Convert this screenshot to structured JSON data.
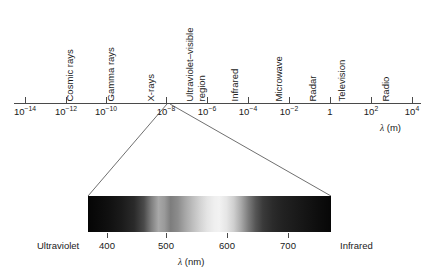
{
  "chart_data": {
    "type": "line",
    "title": "",
    "xlabel": "λ (m)",
    "ylabel": "",
    "grid": false,
    "legend": null,
    "em_axis": {
      "scale": "log10",
      "unit": "m",
      "axis_label": "λ (m)",
      "xlim": [
        -15,
        5
      ],
      "tick_exponents": [
        -14,
        -12,
        -10,
        -8,
        -6,
        -4,
        -2,
        0,
        2,
        4
      ],
      "tick_labels": [
        "10⁻¹⁴",
        "10⁻¹²",
        "10⁻¹⁰",
        "10⁻⁸",
        "10⁻⁶",
        "10⁻⁴",
        "10⁻²",
        "1",
        "10²",
        "10⁴"
      ],
      "regions": [
        {
          "label": "Cosmic rays",
          "lines": [
            "Cosmic rays"
          ],
          "exponent": -14
        },
        {
          "label": "Gamma rays",
          "lines": [
            "Gamma rays"
          ],
          "exponent": -12
        },
        {
          "label": "X-rays",
          "lines": [
            "X-rays"
          ],
          "exponent": -10
        },
        {
          "label": "Ultraviolet–visible region",
          "lines": [
            "Ultraviolet–visible",
            "region"
          ],
          "exponent": -8
        },
        {
          "label": "Infrared",
          "lines": [
            "Infrared"
          ],
          "exponent": -6
        },
        {
          "label": "Microwave",
          "lines": [
            "Microwave"
          ],
          "exponent": -4
        },
        {
          "label": "Radar",
          "lines": [
            "Radar"
          ],
          "exponent": -3
        },
        {
          "label": "Television",
          "lines": [
            "Television"
          ],
          "exponent": -2
        },
        {
          "label": "Radio",
          "lines": [
            "Radio"
          ],
          "exponent": 0
        }
      ]
    },
    "visible_band": {
      "unit": "nm",
      "axis_label": "λ (nm)",
      "xlim": [
        380,
        780
      ],
      "tick_values": [
        400,
        500,
        600,
        700
      ],
      "tick_labels": [
        "400",
        "500",
        "600",
        "700"
      ],
      "left_endcap_label": "Ultraviolet",
      "right_endcap_label": "Infrared",
      "rendering": "grayscale",
      "gradient_stops": [
        {
          "pos_pct": 0,
          "color": "#050505"
        },
        {
          "pos_pct": 14,
          "color": "#1b1b1b"
        },
        {
          "pos_pct": 26,
          "color": "#7e7e7e"
        },
        {
          "pos_pct": 29,
          "color": "#a8a8a8"
        },
        {
          "pos_pct": 34,
          "color": "#7d7d7d"
        },
        {
          "pos_pct": 46,
          "color": "#d2d2d2"
        },
        {
          "pos_pct": 54,
          "color": "#f2f2f2"
        },
        {
          "pos_pct": 66,
          "color": "#7c7c7c"
        },
        {
          "pos_pct": 76,
          "color": "#2b2b2b"
        },
        {
          "pos_pct": 100,
          "color": "#070707"
        }
      ]
    },
    "callout": {
      "description": "Expansion lines from the ultraviolet-visible tick on the log axis to the corners of the visible spectrum band",
      "apex_exponent": -8,
      "apex": [
        167,
        104
      ],
      "left_corner": [
        88,
        196
      ],
      "right_corner": [
        331,
        196
      ]
    }
  },
  "colors": {
    "background": "#ffffff",
    "axis": "#4a4a4a",
    "text": "#1a1a1a",
    "callout_line": "#4a4a4a"
  }
}
